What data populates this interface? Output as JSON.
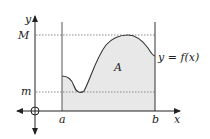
{
  "diagram": {
    "type": "area-under-curve",
    "labels": {
      "y_axis": "y",
      "x_axis": "x",
      "upper_bound": "M",
      "lower_bound": "m",
      "left_limit": "a",
      "right_limit": "b",
      "area": "A",
      "function": "y = f(x)"
    },
    "colors": {
      "stroke": "#333333",
      "fill": "#e8e8e8",
      "dotted": "#888888"
    }
  }
}
